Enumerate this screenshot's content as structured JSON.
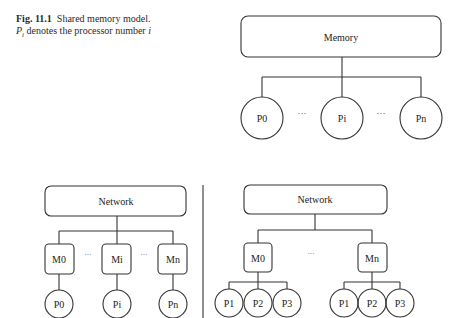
{
  "caption": {
    "label": "Fig. 11.1",
    "text_before_sym": "Shared memory model. ",
    "symbol": "P",
    "subscript": "i",
    "text_after_sym": " denotes the processor number ",
    "italic_var": "i"
  },
  "top_diagram": {
    "memory_label": "Memory",
    "processors": [
      "P0",
      "Pi",
      "Pn"
    ],
    "ellipsis": "···"
  },
  "bottom_left_diagram": {
    "network_label": "Network",
    "memories": [
      "M0",
      "Mi",
      "Mn"
    ],
    "processors": [
      "P0",
      "Pi",
      "Pn"
    ],
    "ellipsis": "···"
  },
  "bottom_right_diagram": {
    "network_label": "Network",
    "memories": [
      "M0",
      "Mn"
    ],
    "group0_processors": [
      "P1",
      "P2",
      "P3"
    ],
    "groupn_processors": [
      "P1",
      "P2",
      "P3"
    ],
    "ellipsis": "···"
  }
}
